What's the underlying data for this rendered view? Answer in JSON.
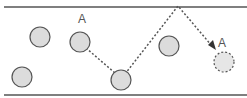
{
  "diagram": {
    "colors": {
      "line": "#555555",
      "circle_fill": "#dcdcdc",
      "circle_stroke": "#555555"
    },
    "labels": [
      {
        "text": "A",
        "x": 78,
        "y": 13
      },
      {
        "text": "A",
        "x": 218,
        "y": 37
      }
    ],
    "circles": [
      {
        "id": "circle-1",
        "cx": 40,
        "cy": 37,
        "style": "solid"
      },
      {
        "id": "circle-a-start",
        "cx": 80,
        "cy": 42,
        "style": "solid"
      },
      {
        "id": "circle-3",
        "cx": 22,
        "cy": 77,
        "style": "solid"
      },
      {
        "id": "circle-4",
        "cx": 121,
        "cy": 80,
        "style": "solid"
      },
      {
        "id": "circle-5",
        "cx": 169,
        "cy": 46,
        "style": "solid"
      },
      {
        "id": "circle-a-end",
        "cx": 224,
        "cy": 62,
        "style": "dashed"
      }
    ],
    "path": [
      [
        80,
        42
      ],
      [
        121,
        80
      ],
      [
        178,
        6
      ],
      [
        214,
        48
      ]
    ]
  }
}
